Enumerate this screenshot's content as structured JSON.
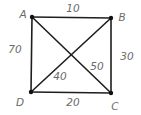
{
  "graph": {
    "nodes": [
      {
        "id": "A",
        "label": "A",
        "x": 32,
        "y": 17,
        "lx": 23,
        "ly": 15
      },
      {
        "id": "B",
        "label": "B",
        "x": 111,
        "y": 18,
        "lx": 122,
        "ly": 18
      },
      {
        "id": "C",
        "label": "C",
        "x": 111,
        "y": 93,
        "lx": 115,
        "ly": 107
      },
      {
        "id": "D",
        "label": "D",
        "x": 31,
        "y": 92,
        "lx": 20,
        "ly": 103
      }
    ],
    "edges": [
      {
        "from": "A",
        "to": "B",
        "weight": "10",
        "wx": 73,
        "wy": 9
      },
      {
        "from": "B",
        "to": "C",
        "weight": "30",
        "wx": 127,
        "wy": 57
      },
      {
        "from": "D",
        "to": "C",
        "weight": "20",
        "wx": 73,
        "wy": 103
      },
      {
        "from": "A",
        "to": "D",
        "weight": "70",
        "wx": 15,
        "wy": 50
      },
      {
        "from": "A",
        "to": "C",
        "weight": "50",
        "wx": 97,
        "wy": 67
      },
      {
        "from": "D",
        "to": "B",
        "weight": "40",
        "wx": 60,
        "wy": 77
      }
    ]
  },
  "colors": {
    "edge": "#1e1e1e",
    "node": "#111111",
    "text": "#6a6a6a"
  }
}
